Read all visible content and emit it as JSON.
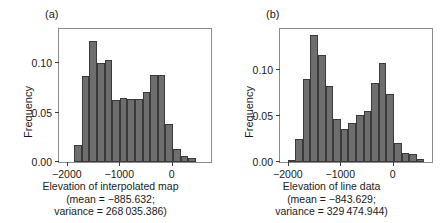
{
  "figure": {
    "background": "#ffffff",
    "bar_fill": "#6e6e6e",
    "bar_edge": "#3a3a3a",
    "frame_color": "#8c8c8c"
  },
  "panels": [
    {
      "label": "(a)",
      "ylabel": "Frequency",
      "caption_line1": "Elevation of interpolated map",
      "caption_line2": "(mean = −885.632;",
      "caption_line3": "variance = 268 035.386)",
      "yticks": [
        "0.00",
        "0.05",
        "0.10"
      ],
      "xticks": [
        "−2000",
        "−1000",
        "0"
      ]
    },
    {
      "label": "(b)",
      "ylabel": "Frequency",
      "caption_line1": "Elevation of line data",
      "caption_line2": "(mean = −843.629;",
      "caption_line3": "variance = 329 474.944)",
      "yticks": [
        "0.00",
        "0.05",
        "0.10"
      ],
      "xticks": [
        "−2000",
        "−1000",
        "0"
      ]
    }
  ],
  "chart_data": [
    {
      "type": "bar",
      "title": "(a) Elevation of interpolated map",
      "xlabel": "Elevation of interpolated map",
      "ylabel": "Frequency",
      "xlim": [
        -2150,
        750
      ],
      "ylim": [
        0.0,
        0.135
      ],
      "xticks": [
        -2000,
        -1000,
        0
      ],
      "yticks": [
        0.0,
        0.05,
        0.1
      ],
      "grid": false,
      "legend": null,
      "bin_width": 145,
      "bin_left_edges": [
        -2150,
        -2005,
        -1860,
        -1715,
        -1570,
        -1425,
        -1280,
        -1135,
        -990,
        -845,
        -700,
        -555,
        -410,
        -265,
        -120,
        25,
        170,
        315,
        460,
        605
      ],
      "values": [
        0.0,
        0.0,
        0.017,
        0.087,
        0.123,
        0.1,
        0.104,
        0.063,
        0.065,
        0.064,
        0.064,
        0.071,
        0.088,
        0.088,
        0.039,
        0.013,
        0.006,
        0.004,
        0.0,
        0.0
      ],
      "mean": -885.632,
      "variance": 268035.386
    },
    {
      "type": "bar",
      "title": "(b) Elevation of line data",
      "xlabel": "Elevation of line data",
      "ylabel": "Frequency",
      "xlim": [
        -2150,
        750
      ],
      "ylim": [
        0.0,
        0.145
      ],
      "xticks": [
        -2000,
        -1000,
        0
      ],
      "yticks": [
        0.0,
        0.05,
        0.1
      ],
      "grid": false,
      "legend": null,
      "bin_width": 145,
      "bin_left_edges": [
        -2150,
        -2005,
        -1860,
        -1715,
        -1570,
        -1425,
        -1280,
        -1135,
        -990,
        -845,
        -700,
        -555,
        -410,
        -265,
        -120,
        25,
        170,
        315,
        460,
        605
      ],
      "values": [
        0.0,
        0.002,
        0.025,
        0.09,
        0.139,
        0.117,
        0.083,
        0.047,
        0.036,
        0.043,
        0.051,
        0.056,
        0.086,
        0.108,
        0.074,
        0.021,
        0.01,
        0.009,
        0.003,
        0.0
      ],
      "mean": -843.629,
      "variance": 329474.944
    }
  ]
}
